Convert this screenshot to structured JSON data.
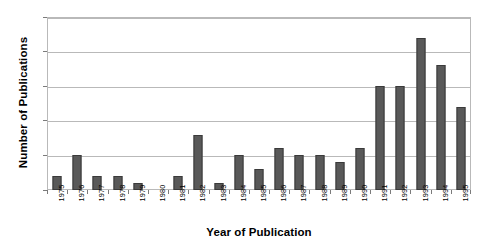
{
  "chart_data": {
    "type": "bar",
    "title": "",
    "subtitle": "",
    "xlabel": "Year of Publication",
    "ylabel": "Number of Publications",
    "categories": [
      "1975",
      "1976",
      "1977",
      "1978",
      "1979",
      "1980",
      "1981",
      "1982",
      "1983",
      "1984",
      "1985",
      "1986",
      "1987",
      "1988",
      "1989",
      "1990",
      "1991",
      "1992",
      "1993",
      "1994",
      "1995"
    ],
    "values": [
      2,
      5,
      2,
      2,
      1,
      0,
      2,
      8,
      1,
      5,
      3,
      6,
      5,
      5,
      4,
      6,
      15,
      15,
      22,
      18,
      12
    ],
    "series": [
      {
        "name": "Publications",
        "values": [
          2,
          5,
          2,
          2,
          1,
          0,
          2,
          8,
          1,
          5,
          3,
          6,
          5,
          5,
          4,
          6,
          15,
          15,
          22,
          18,
          12
        ]
      }
    ],
    "ylim": [
      0,
      25
    ],
    "yticks": [
      0,
      5,
      10,
      15,
      20,
      25
    ],
    "ytick_labels": [
      "0",
      "5",
      "10",
      "15",
      "20",
      "25"
    ],
    "grid": true,
    "grid_axis": "y",
    "legend": false,
    "legend_position": "none",
    "bar_color": "#595959",
    "bar_edge_color": "#3a3a3a",
    "grid_color": "#b9b9b9",
    "plot_background": "#ffffff",
    "figure_background": "#ffffff",
    "annotations": []
  }
}
